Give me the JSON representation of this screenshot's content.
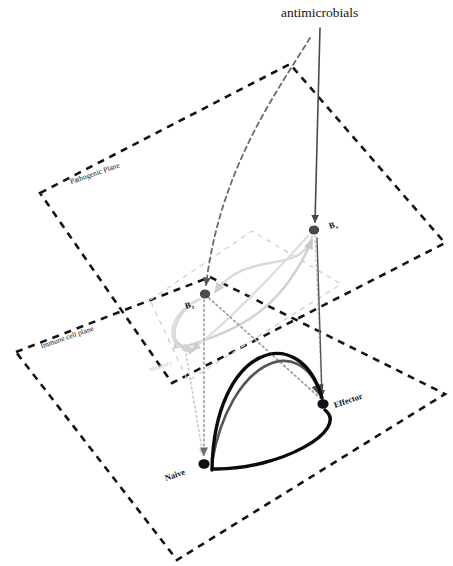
{
  "figure": {
    "type": "diagram",
    "title_label": "antimicrobials",
    "background_color": "#ffffff"
  },
  "planes": [
    {
      "id": "pathogenic-plane",
      "label": "Pathogenic Plane",
      "color": "#141414",
      "style": "dashed",
      "label_rotation": -19,
      "points": "40,193 290,64 445,243 172,383"
    },
    {
      "id": "immune-cell-plane",
      "label": "Immune cell plane",
      "color": "#141414",
      "style": "dashed",
      "label_rotation": -19,
      "points": "16,352 210,277 445,394 177,560"
    },
    {
      "id": "inner-resistance-plane",
      "label": "",
      "color": "#cfcfcf",
      "style": "dashed",
      "label_rotation": 0,
      "points": "150,300 252,231 341,284 188,381"
    }
  ],
  "nodes": [
    {
      "id": "bs",
      "label": "B",
      "sub": "s",
      "x": 314,
      "y": 230,
      "r": 5.2,
      "color": "#4a4a4a",
      "label_x": 330,
      "label_y": 229,
      "label_rotation": -19
    },
    {
      "id": "br",
      "label": "B",
      "sub": "r",
      "x": 205,
      "y": 294,
      "r": 5.2,
      "color": "#4a4a4a",
      "label_x": 186,
      "label_y": 309,
      "label_rotation": -19
    },
    {
      "id": "memory",
      "label": "Memory",
      "sub": "",
      "x": 186,
      "y": 348,
      "r": 4.6,
      "color": "#d2d2d2",
      "label_x": 150,
      "label_y": 372,
      "label_rotation": -19
    },
    {
      "id": "effector",
      "label": "Effector",
      "sub": "",
      "x": 323,
      "y": 404,
      "r": 5.6,
      "color": "#111111",
      "label_x": 335,
      "label_y": 408,
      "label_rotation": -19
    },
    {
      "id": "naive",
      "label": "Naive",
      "sub": "",
      "x": 204,
      "y": 464,
      "r": 5.6,
      "color": "#111111",
      "label_x": 166,
      "label_y": 481,
      "label_rotation": -19
    }
  ],
  "edges": [
    {
      "id": "antimicrobials-to-bs",
      "from": "antimicrobials",
      "to": "bs",
      "color": "#4a4a4a",
      "style": "solid",
      "width": 1.6,
      "arrow": true,
      "path": "M 320,28 L 315,222"
    },
    {
      "id": "antimicrobials-to-br",
      "from": "antimicrobials",
      "to": "br",
      "color": "#6b6b6b",
      "style": "dashed",
      "width": 1.8,
      "arrow": true,
      "path": "M 310,38 C 274,96 220,170 206,285"
    },
    {
      "id": "bs-to-br-mutation",
      "from": "bs",
      "to": "br",
      "color": "#d9d9d9",
      "style": "solid",
      "width": 2.4,
      "arrow": true,
      "path": "M 312,237 C 299,277 250,247 215,292"
    },
    {
      "id": "br-to-memory",
      "from": "br",
      "to": "memory",
      "color": "#d9d9d9",
      "style": "solid",
      "width": 2.4,
      "arrow": true,
      "path": "M 200,299 C 173,312 168,343 183,346"
    },
    {
      "id": "memory-to-bs",
      "from": "memory",
      "to": "bs",
      "color": "#d0d0d0",
      "style": "solid",
      "width": 2.4,
      "arrow": true,
      "path": "M 190,345 C 238,330 282,310 312,240"
    },
    {
      "id": "bs-to-memory",
      "from": "bs",
      "to": "memory",
      "color": "#dedede",
      "style": "solid",
      "width": 2.2,
      "arrow": true,
      "path": "M 308,236 C 272,276 230,320 192,350"
    },
    {
      "id": "br-self-loop",
      "from": "br",
      "to": "br",
      "color": "#dcdcdc",
      "style": "solid",
      "width": 2.2,
      "arrow": true,
      "path": "M 199,299 C 160,318 168,355 196,349"
    },
    {
      "id": "bs-to-effector-dotted",
      "from": "bs",
      "to": "effector",
      "color": "#cccccc",
      "style": "dotted",
      "width": 1.6,
      "arrow": false,
      "path": "M 315,236 L 322,397"
    },
    {
      "id": "memory-to-naive-dotted",
      "from": "memory",
      "to": "naive",
      "color": "#c8c8c8",
      "style": "dotted",
      "width": 1.6,
      "arrow": true,
      "path": "M 186,354 L 203,455"
    },
    {
      "id": "br-to-naive-dotted",
      "from": "br",
      "to": "naive",
      "color": "#a8a8a8",
      "style": "dotted",
      "width": 1.8,
      "arrow": true,
      "path": "M 204,300 L 204,455"
    },
    {
      "id": "br-to-effector-dotted",
      "from": "br",
      "to": "effector",
      "color": "#a0a0a0",
      "style": "dotted",
      "width": 1.8,
      "arrow": false,
      "path": "M 209,298 L 320,398"
    },
    {
      "id": "bs-vertical-to-effector",
      "from": "bs",
      "to": "effector",
      "color": "#555555",
      "style": "solid",
      "width": 1.4,
      "arrow": true,
      "path": "M 317,238 L 322,396"
    },
    {
      "id": "naive-to-effector-gray",
      "from": "naive",
      "to": "effector",
      "color": "#555555",
      "style": "solid",
      "width": 2.6,
      "arrow": true,
      "path": "M 212,462 C 230,360 300,330 321,396"
    },
    {
      "id": "naive-to-effector-black",
      "from": "naive",
      "to": "effector",
      "color": "#0b0b0b",
      "style": "solid",
      "width": 3.4,
      "arrow": false,
      "path": "M 214,469 C 280,470 350,430 325,410"
    },
    {
      "id": "effector-to-naive-black",
      "from": "effector",
      "to": "naive",
      "color": "#0b0b0b",
      "style": "solid",
      "width": 3.4,
      "arrow": false,
      "path": "M 322,398 C 300,320 214,345 212,470"
    }
  ]
}
